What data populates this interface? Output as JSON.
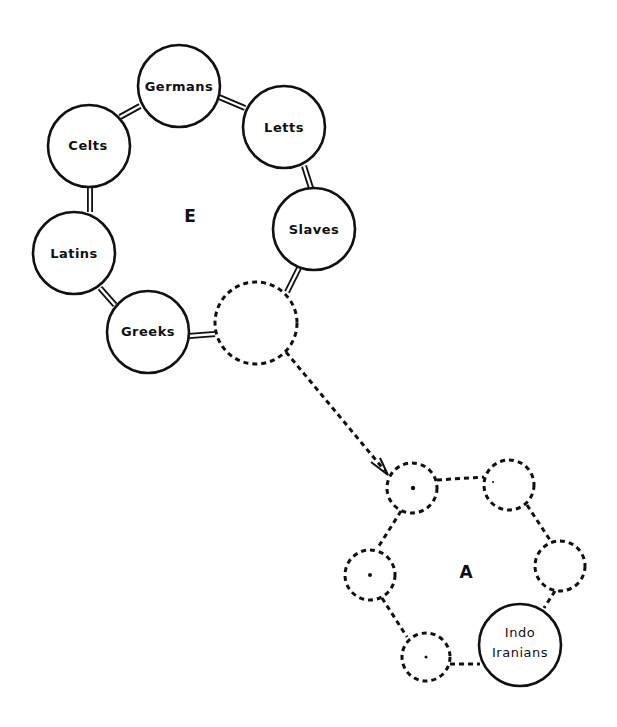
{
  "diagram": {
    "groups": [
      {
        "id": "E",
        "label": "E",
        "nodes": [
          {
            "id": "germans",
            "label": "Germans",
            "style": "solid"
          },
          {
            "id": "letts",
            "label": "Letts",
            "style": "solid"
          },
          {
            "id": "slaves",
            "label": "Slaves",
            "style": "solid"
          },
          {
            "id": "unnamed-e",
            "label": "",
            "style": "dashed"
          },
          {
            "id": "greeks",
            "label": "Greeks",
            "style": "solid"
          },
          {
            "id": "latins",
            "label": "Latins",
            "style": "solid"
          },
          {
            "id": "celts",
            "label": "Celts",
            "style": "solid"
          }
        ],
        "links": "double-line ring"
      },
      {
        "id": "A",
        "label": "A",
        "nodes": [
          {
            "id": "a-top-left",
            "label": "",
            "style": "dashed"
          },
          {
            "id": "a-top-right",
            "label": "",
            "style": "dashed"
          },
          {
            "id": "a-right",
            "label": "",
            "style": "dashed"
          },
          {
            "id": "indo-iranians",
            "label": "Indo Iranians",
            "label_lines": [
              "Indo",
              "Iranians"
            ],
            "style": "solid"
          },
          {
            "id": "a-bottom",
            "label": "",
            "style": "dashed"
          },
          {
            "id": "a-left",
            "label": "",
            "style": "dashed"
          }
        ],
        "links": "dashed ring"
      }
    ],
    "edges": [
      {
        "from": "unnamed-e",
        "to": "a-top-left",
        "style": "dashed-arrow"
      }
    ]
  }
}
